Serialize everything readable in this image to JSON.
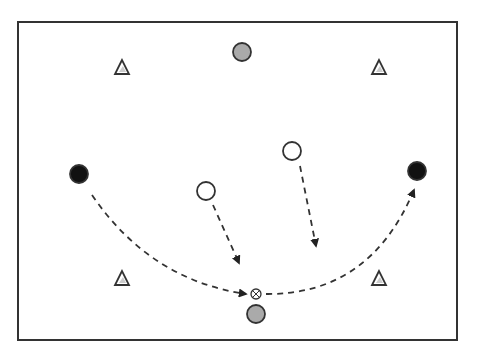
{
  "diagram": {
    "type": "sports-drill",
    "field": {
      "x": 18,
      "y": 22,
      "width": 439,
      "height": 318,
      "stroke": "#333333"
    },
    "colors": {
      "black": "#111111",
      "grey": "#aaaaaa",
      "white": "#ffffff",
      "stroke": "#333333",
      "dash": "#333333"
    },
    "cones": [
      {
        "id": "cone-top-left",
        "x": 122,
        "y": 68
      },
      {
        "id": "cone-top-right",
        "x": 379,
        "y": 68
      },
      {
        "id": "cone-bottom-left",
        "x": 122,
        "y": 279
      },
      {
        "id": "cone-bottom-right",
        "x": 379,
        "y": 279
      }
    ],
    "players": [
      {
        "id": "grey-player-top",
        "kind": "grey",
        "x": 242,
        "y": 52,
        "r": 9
      },
      {
        "id": "grey-player-bottom",
        "kind": "grey",
        "x": 256,
        "y": 314,
        "r": 9
      },
      {
        "id": "black-player-left",
        "kind": "black",
        "x": 79,
        "y": 174,
        "r": 9
      },
      {
        "id": "black-player-right",
        "kind": "black",
        "x": 417,
        "y": 171,
        "r": 9
      },
      {
        "id": "white-player-left",
        "kind": "white",
        "x": 206,
        "y": 191,
        "r": 9
      },
      {
        "id": "white-player-right",
        "kind": "white",
        "x": 292,
        "y": 151,
        "r": 9
      }
    ],
    "ball": {
      "x": 256,
      "y": 294,
      "r": 5
    },
    "paths": [
      {
        "id": "pass-left-to-ball",
        "d": "M 92 195 Q 150 280 246 294"
      },
      {
        "id": "pass-ball-to-right",
        "d": "M 266 294 Q 370 295 414 190"
      },
      {
        "id": "run-white-left",
        "d": "M 213 205 L 239 263"
      },
      {
        "id": "run-white-right",
        "d": "M 300 166 L 316 246"
      }
    ]
  }
}
